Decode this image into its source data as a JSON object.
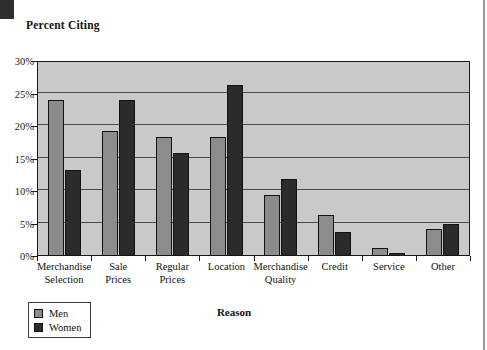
{
  "chart_title": "Percent Citing",
  "axis": {
    "x_title": "Reason",
    "y_ticks": [
      "0%",
      "5%",
      "10%",
      "15%",
      "20%",
      "25%",
      "30%"
    ]
  },
  "legend": {
    "items": [
      {
        "label": "Men",
        "color": "#8c8c8c"
      },
      {
        "label": "Women",
        "color": "#2b2b2b"
      }
    ]
  },
  "chart_data": {
    "type": "bar",
    "title": "Percent Citing",
    "xlabel": "Reason",
    "ylabel": "Percent Citing",
    "ylim": [
      0,
      30
    ],
    "ytick_step": 5,
    "ytick_format": "percent",
    "grid": true,
    "legend_position": "bottom-left",
    "categories": [
      "Merchandise\nSelection",
      "Sale\nPrices",
      "Regular\nPrices",
      "Location",
      "Merchandise\nQuality",
      "Credit",
      "Service",
      "Other"
    ],
    "series": [
      {
        "name": "Men",
        "color": "#8c8c8c",
        "values": [
          24.0,
          19.2,
          18.3,
          18.3,
          9.4,
          6.3,
          1.2,
          4.2
        ]
      },
      {
        "name": "Women",
        "color": "#2b2b2b",
        "values": [
          13.3,
          24.0,
          15.9,
          26.3,
          11.8,
          3.7,
          0.5,
          5.0
        ]
      }
    ]
  }
}
